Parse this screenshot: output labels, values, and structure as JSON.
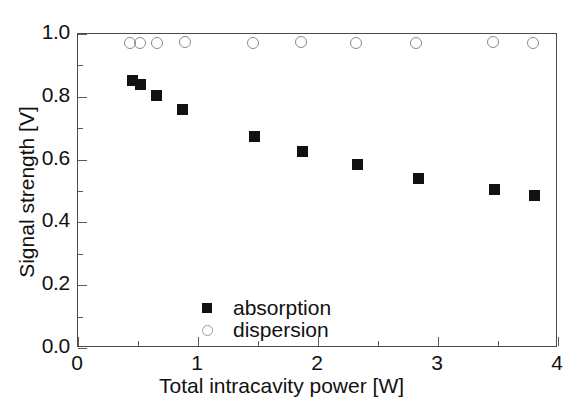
{
  "chart_data": {
    "type": "scatter",
    "title": "",
    "xlabel": "Total intracavity power [W]",
    "ylabel": "Signal strength [V]",
    "xlim": [
      0,
      4
    ],
    "ylim": [
      0.0,
      1.0
    ],
    "xticks": [
      "0",
      "1",
      "2",
      "3",
      "4"
    ],
    "xtick_values": [
      0,
      1,
      2,
      3,
      4
    ],
    "yticks": [
      "0.0",
      "0.2",
      "0.4",
      "0.6",
      "0.8",
      "1.0"
    ],
    "ytick_values": [
      0.0,
      0.2,
      0.4,
      0.6,
      0.8,
      1.0
    ],
    "grid": false,
    "legend_position": "center-left",
    "series": [
      {
        "name": "absorption",
        "marker": "filled-square",
        "color": "#111111",
        "x": [
          0.45,
          0.52,
          0.65,
          0.87,
          1.47,
          1.87,
          2.33,
          2.84,
          3.47,
          3.8
        ],
        "y": [
          0.851,
          0.838,
          0.803,
          0.761,
          0.675,
          0.627,
          0.583,
          0.541,
          0.506,
          0.487
        ]
      },
      {
        "name": "dispersion",
        "marker": "open-circle",
        "color": "#8c8c8c",
        "x": [
          0.43,
          0.52,
          0.66,
          0.89,
          1.46,
          1.86,
          2.32,
          2.82,
          3.46,
          3.79
        ],
        "y": [
          0.972,
          0.972,
          0.972,
          0.975,
          0.972,
          0.975,
          0.972,
          0.972,
          0.975,
          0.972
        ]
      }
    ]
  },
  "legend": {
    "entries": [
      {
        "label": "absorption",
        "marker": "filled-square"
      },
      {
        "label": "dispersion",
        "marker": "open-circle"
      }
    ]
  },
  "axes": {
    "x_title": "Total intracavity power [W]",
    "y_title": "Signal strength [V]"
  }
}
